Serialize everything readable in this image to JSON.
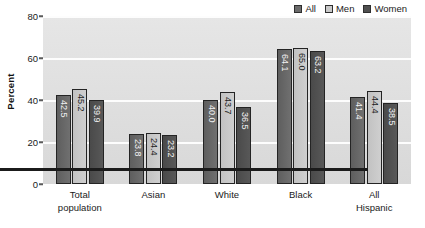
{
  "chart_data": {
    "type": "bar",
    "title": "",
    "subtitle": "",
    "xlabel": "",
    "ylabel": "Percent",
    "ylim": [
      0,
      80
    ],
    "yticks": [
      0,
      20,
      40,
      60,
      80
    ],
    "ytick_labels": [
      "0",
      "20",
      "40",
      "60",
      "80"
    ],
    "grid": true,
    "grid_axis": "y",
    "legend_position": "top-right",
    "categories": [
      "Total population",
      "Asian",
      "White",
      "Black",
      "All Hispanic"
    ],
    "category_lines": [
      [
        "Total",
        "population"
      ],
      [
        "Asian",
        ""
      ],
      [
        "White",
        ""
      ],
      [
        "Black",
        ""
      ],
      [
        "All",
        "Hispanic"
      ]
    ],
    "series": [
      {
        "name": "All",
        "color": "#6b6b6b",
        "values": [
          42.5,
          23.8,
          40.0,
          64.1,
          41.4
        ],
        "value_labels": [
          "42.5",
          "23.8",
          "40.0",
          "64.1",
          "41.4"
        ]
      },
      {
        "name": "Men",
        "color": "#c9c9c9",
        "values": [
          45.2,
          24.4,
          43.7,
          65.0,
          44.4
        ],
        "value_labels": [
          "45.2",
          "24.4",
          "43.7",
          "65.0",
          "44.4"
        ]
      },
      {
        "name": "Women",
        "color": "#4f4f4f",
        "values": [
          39.9,
          23.2,
          36.5,
          63.2,
          38.5
        ],
        "value_labels": [
          "39.9",
          "23.2",
          "36.5",
          "63.2",
          "38.5"
        ]
      }
    ]
  },
  "legend": {
    "items": [
      {
        "label": "All",
        "color": "#6b6b6b"
      },
      {
        "label": "Men",
        "color": "#c9c9c9"
      },
      {
        "label": "Women",
        "color": "#4f4f4f"
      }
    ]
  },
  "axis": {
    "y_title": "Percent"
  },
  "style": {
    "plot_background": "#e0e0e0",
    "gridline_color": "#fdfdfd",
    "axis_color": "#1b1b1b",
    "bar_border": "#242424",
    "text_color": "#1a1a1a"
  }
}
